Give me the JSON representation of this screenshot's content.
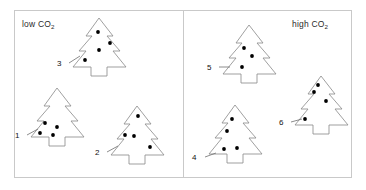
{
  "figure": {
    "background": "#ffffff",
    "outline_color": "#8f8f8f",
    "dot_color": "#000000",
    "panel_border_color": "#c9c9c9"
  },
  "panels": [
    {
      "id": "low",
      "title_text": "low CO",
      "title_sub": "2",
      "trees": [
        {
          "label": "3",
          "dots": 3,
          "x": 68,
          "y": 16,
          "w": 62,
          "h": 62,
          "label_x": -11,
          "label_y": 44,
          "leader": "M 1,47 L 12,40",
          "dot_points": [
            [
              30,
              16
            ],
            [
              42,
              27
            ],
            [
              31,
              34
            ],
            [
              17,
              44
            ]
          ]
        },
        {
          "label": "1",
          "dots": 3,
          "x": 26,
          "y": 86,
          "w": 62,
          "h": 62,
          "label_x": -11,
          "label_y": 46,
          "leader": "M 1,49 L 12,43",
          "dot_points": [
            [
              19,
              37
            ],
            [
              31,
              41
            ],
            [
              27,
              49
            ],
            [
              14,
              47
            ]
          ]
        },
        {
          "label": "2",
          "dots": 3,
          "x": 106,
          "y": 104,
          "w": 62,
          "h": 62,
          "label_x": -11,
          "label_y": 45,
          "leader": "M 1,48 L 12,42",
          "dot_points": [
            [
              32,
              12
            ],
            [
              19,
              31
            ],
            [
              28,
              32
            ],
            [
              44,
              43
            ]
          ]
        }
      ]
    },
    {
      "id": "high",
      "title_text": "high CO",
      "title_sub": "2",
      "trees": [
        {
          "label": "5",
          "dots": 3,
          "x": 218,
          "y": 23,
          "w": 62,
          "h": 62,
          "label_x": -11,
          "label_y": 41,
          "leader": "M 1,44 L 12,44",
          "dot_points": [
            [
              26,
              25
            ],
            [
              34,
              33
            ],
            [
              24,
              44
            ]
          ]
        },
        {
          "label": "6",
          "dots": 3,
          "x": 290,
          "y": 74,
          "w": 62,
          "h": 62,
          "label_x": -11,
          "label_y": 45,
          "leader": "M 1,48 L 12,45",
          "dot_points": [
            [
              28,
              11
            ],
            [
              24,
              18
            ],
            [
              36,
              27
            ],
            [
              15,
              45
            ]
          ]
        },
        {
          "label": "4",
          "dots": 3,
          "x": 204,
          "y": 103,
          "w": 62,
          "h": 62,
          "label_x": -12,
          "label_y": 51,
          "leader": "M 1,54 L 12,50",
          "dot_points": [
            [
              28,
              16
            ],
            [
              23,
              28
            ],
            [
              20,
              46
            ],
            [
              33,
              45
            ]
          ]
        }
      ]
    }
  ]
}
